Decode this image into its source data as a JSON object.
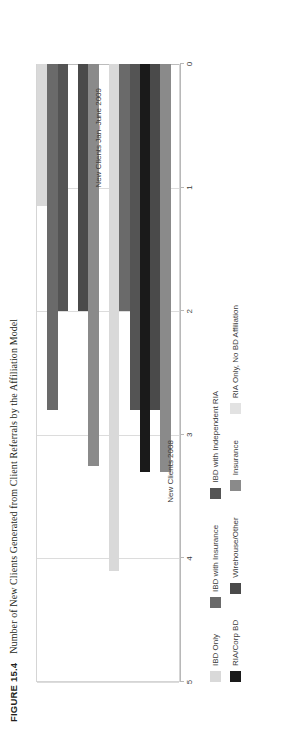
{
  "caption": {
    "figure_number": "FIGURE 15.4",
    "text": "Number of New Clients Generated from Client Referrals by the Affiliation Model"
  },
  "chart_data": {
    "type": "bar",
    "orientation": "horizontal-grouped",
    "title": "Number of New Clients Generated from Client Referrals by the Affiliation Model",
    "xlabel": "",
    "ylabel": "",
    "xlim": [
      0,
      5
    ],
    "xticks": [
      "0",
      "1",
      "2",
      "3",
      "4",
      "5"
    ],
    "grid": true,
    "legend_position": "bottom",
    "categories": [
      "New Clients 2008",
      "New Clients Jan–June 2009"
    ],
    "series": [
      {
        "name": "IBD Only",
        "color": "#d9d9d9",
        "values": [
          4.1,
          1.15
        ]
      },
      {
        "name": "IBD with Insurance",
        "color": "#6a6a6a",
        "values": [
          2.0,
          2.8
        ]
      },
      {
        "name": "IBD with Independent RIA",
        "color": "#545454",
        "values": [
          2.8,
          2.0
        ]
      },
      {
        "name": "RIA/Corp BD",
        "color": "#1a1a1a",
        "values": [
          3.3,
          0.0
        ]
      },
      {
        "name": "Wirehouse/Other",
        "color": "#4a4a4a",
        "values": [
          2.8,
          2.0
        ]
      },
      {
        "name": "Insurance",
        "color": "#8a8a8a",
        "values": [
          3.3,
          3.25
        ]
      },
      {
        "name": "RIA Only, No BD Affiliation",
        "color": "#e2e2e2",
        "values": [
          0.0,
          0.0
        ]
      }
    ]
  },
  "legend": {
    "rows": [
      [
        {
          "label": "IBD Only",
          "color": "#d9d9d9"
        },
        {
          "label": "IBD with Insurance",
          "color": "#6a6a6a"
        },
        {
          "label": "IBD with Independent RIA",
          "color": "#545454"
        }
      ],
      [
        {
          "label": "RIA/Corp BD",
          "color": "#1a1a1a"
        },
        {
          "label": "Wirehouse/Other",
          "color": "#4a4a4a"
        },
        {
          "label": "Insurance",
          "color": "#8a8a8a"
        },
        {
          "label": "RIA Only, No BD Affiliation",
          "color": "#e2e2e2"
        }
      ]
    ]
  },
  "axis": {
    "ticks": [
      "0",
      "1",
      "2",
      "3",
      "4",
      "5"
    ]
  }
}
